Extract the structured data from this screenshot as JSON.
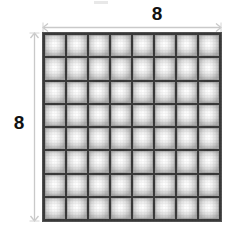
{
  "figure": {
    "name": "square-grid-diagram",
    "shape": "square",
    "rows": 8,
    "columns": 8,
    "total_cells": 64,
    "dimensions": {
      "top": {
        "label": "8",
        "orientation": "horizontal",
        "arrow": "double-headed"
      },
      "left": {
        "label": "8",
        "orientation": "vertical",
        "arrow": "double-headed"
      }
    },
    "colors": {
      "background": "#ffffff",
      "grid_line": "#3a3a3a",
      "cell_center": "#ffffff",
      "cell_edge": "#a9a9a9",
      "dimension_line": "#c9c9c9",
      "label_text": "#111111"
    },
    "icons": {
      "top_arrow": "double-arrow-horizontal-icon",
      "left_arrow": "double-arrow-vertical-icon"
    }
  },
  "cells": [
    [
      "",
      "",
      "",
      "",
      "",
      "",
      "",
      ""
    ],
    [
      "",
      "",
      "",
      "",
      "",
      "",
      "",
      ""
    ],
    [
      "",
      "",
      "",
      "",
      "",
      "",
      "",
      ""
    ],
    [
      "",
      "",
      "",
      "",
      "",
      "",
      "",
      ""
    ],
    [
      "",
      "",
      "",
      "",
      "",
      "",
      "",
      ""
    ],
    [
      "",
      "",
      "",
      "",
      "",
      "",
      "",
      ""
    ],
    [
      "",
      "",
      "",
      "",
      "",
      "",
      "",
      ""
    ],
    [
      "",
      "",
      "",
      "",
      "",
      "",
      "",
      ""
    ]
  ]
}
